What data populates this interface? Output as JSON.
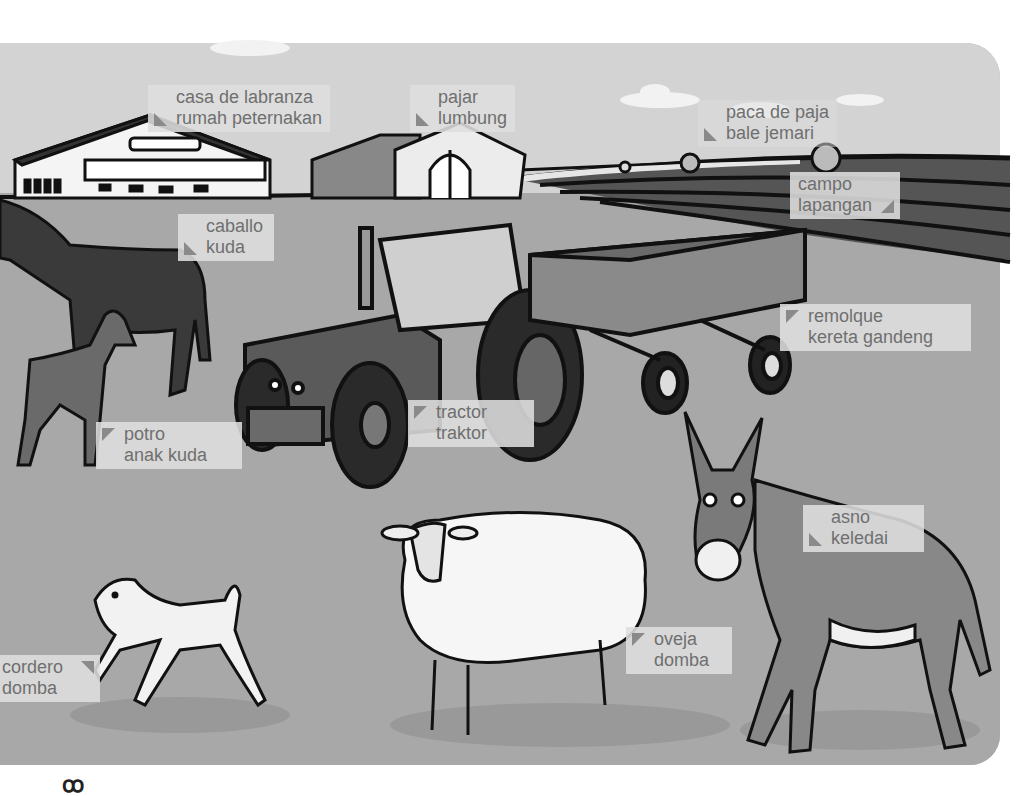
{
  "page": {
    "languages": [
      "Spanish",
      "Indonesian"
    ],
    "colors": {
      "sky": "#d3d3d3",
      "ground": "#a8a8a8",
      "label_bg": "#dedede",
      "label_text": "#6f6f6f",
      "label_pointer": "#8a8a8a",
      "outline": "#111111"
    }
  },
  "labels": [
    {
      "id": "farmhouse",
      "es": "casa de labranza",
      "id_lang": "rumah peternakan",
      "pointer": "bottom-left",
      "icon": "farmhouse-icon"
    },
    {
      "id": "barn",
      "es": "pajar",
      "id_lang": "lumbung",
      "pointer": "bottom-left",
      "icon": "barn-icon"
    },
    {
      "id": "hay-bale",
      "es": "paca de paja",
      "id_lang": "bale jemari",
      "pointer": "bottom-left",
      "icon": "hay-bale-icon"
    },
    {
      "id": "field",
      "es": "campo",
      "id_lang": "lapangan",
      "pointer": "bottom-right",
      "icon": "field-icon"
    },
    {
      "id": "horse",
      "es": "caballo",
      "id_lang": "kuda",
      "pointer": "bottom-left",
      "icon": "horse-icon"
    },
    {
      "id": "trailer",
      "es": "remolque",
      "id_lang": "kereta gandeng",
      "pointer": "top-left",
      "icon": "trailer-icon"
    },
    {
      "id": "tractor",
      "es": "tractor",
      "id_lang": "traktor",
      "pointer": "top-left",
      "icon": "tractor-icon"
    },
    {
      "id": "foal",
      "es": "potro",
      "id_lang": "anak kuda",
      "pointer": "top-left",
      "icon": "foal-icon"
    },
    {
      "id": "donkey",
      "es": "asno",
      "id_lang": "keledai",
      "pointer": "bottom-left",
      "icon": "donkey-icon"
    },
    {
      "id": "lamb",
      "es": "cordero",
      "id_lang": "domba",
      "pointer": "top-right",
      "icon": "lamb-icon"
    },
    {
      "id": "sheep",
      "es": "oveja",
      "id_lang": "domba",
      "pointer": "top-left",
      "icon": "sheep-icon"
    }
  ],
  "footer": {
    "glyph": "ꝏ"
  }
}
